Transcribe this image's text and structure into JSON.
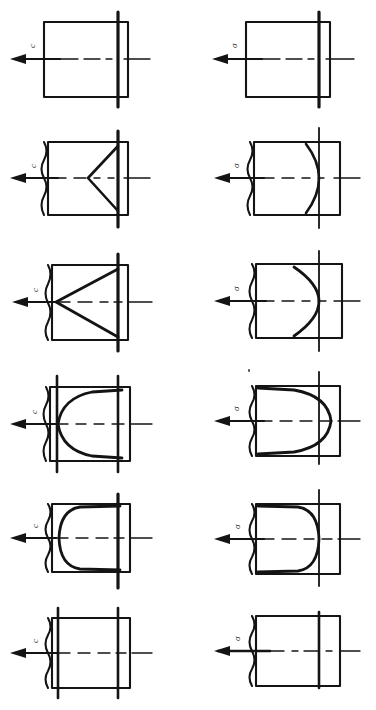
{
  "figure": {
    "background_color": "#ffffff",
    "ink_color": "#141414",
    "columns": [
      {
        "id": "left",
        "load_symbol": "c"
      },
      {
        "id": "right",
        "load_symbol": "σ"
      }
    ],
    "rows": [
      {
        "index": 1,
        "left": {
          "label": "c",
          "profile": "flat-straight",
          "description": "Uniform rectangular block, straight vertical boundary line",
          "vertical_lines": [
            "middle"
          ]
        },
        "right": {
          "label": "σ",
          "profile": "flat-straight",
          "description": "Uniform rectangular block, straight vertical boundary line",
          "vertical_lines": [
            "middle"
          ]
        }
      },
      {
        "index": 2,
        "left": {
          "label": "c",
          "profile": "shallow-vee",
          "description": "Shallow V shaped profile with apex pointing left",
          "vertical_lines": [
            "middle"
          ]
        },
        "right": {
          "label": "σ",
          "profile": "shallow-arc",
          "description": "Shallow curved profile bulging to the right",
          "vertical_lines": [
            "middle"
          ]
        }
      },
      {
        "index": 3,
        "left": {
          "label": "c",
          "profile": "deep-vee",
          "description": "Deep V shaped profile with apex at the left edge",
          "vertical_lines": [
            "middle"
          ]
        },
        "right": {
          "label": "σ",
          "profile": "deep-arc",
          "description": "Deep curved profile bulging past the right line",
          "vertical_lines": [
            "middle"
          ]
        }
      },
      {
        "index": 4,
        "left": {
          "label": "c",
          "profile": "rounded-trapezoid",
          "description": "Rounded trapezoidal bell profile opening left",
          "vertical_lines": [
            "left",
            "middle"
          ]
        },
        "right": {
          "label": "σ",
          "profile": "rounded-trapezoid-right",
          "description": "Rounded trapezoidal profile opening right with curved nose",
          "vertical_lines": [
            "middle"
          ],
          "artifact": "speck"
        }
      },
      {
        "index": 5,
        "left": {
          "label": "c",
          "profile": "rounded-rectangle",
          "description": "Nearly rectangular profile with rounded left corners",
          "vertical_lines": [
            "middle"
          ]
        },
        "right": {
          "label": "σ",
          "profile": "rounded-rectangle-right",
          "description": "Nearly rectangular profile with rounded right corners",
          "vertical_lines": [
            "middle"
          ]
        }
      },
      {
        "index": 6,
        "left": {
          "label": "c",
          "profile": "plain-rectangle",
          "description": "Plain rectangle with left and middle vertical lines",
          "vertical_lines": [
            "left",
            "middle"
          ]
        },
        "right": {
          "label": "σ",
          "profile": "plain-rectangle-right",
          "description": "Plain rectangle with a single vertical line near the right",
          "vertical_lines": [
            "right"
          ]
        }
      }
    ],
    "annotations": {
      "arrow": "leftward-force-arrow",
      "centerline": "dash-dot-axis"
    }
  }
}
